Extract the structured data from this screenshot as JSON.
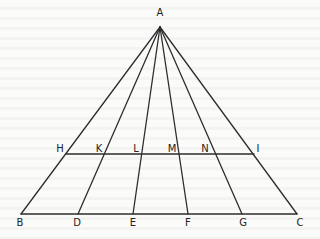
{
  "diagram": {
    "type": "geometry-triangle-with-cevians",
    "points": {
      "A": {
        "x": 160,
        "y": 27,
        "label": "A",
        "lx": 160,
        "ly": 16
      },
      "B": {
        "x": 21,
        "y": 214,
        "label": "B",
        "lx": 20,
        "ly": 226
      },
      "D": {
        "x": 78,
        "y": 214,
        "label": "D",
        "lx": 77,
        "ly": 226
      },
      "E": {
        "x": 133,
        "y": 214,
        "label": "E",
        "lx": 133,
        "ly": 226
      },
      "F": {
        "x": 188,
        "y": 214,
        "label": "F",
        "lx": 188,
        "ly": 226
      },
      "G": {
        "x": 242,
        "y": 214,
        "label": "G",
        "lx": 243,
        "ly": 226
      },
      "C": {
        "x": 297,
        "y": 214,
        "label": "C",
        "lx": 300,
        "ly": 226
      },
      "H": {
        "x": 66,
        "y": 154,
        "label": "H",
        "lx": 60,
        "ly": 152
      },
      "K": {
        "x": 104,
        "y": 154,
        "label": "K",
        "lx": 99,
        "ly": 152
      },
      "L": {
        "x": 142,
        "y": 154,
        "label": "L",
        "lx": 136,
        "ly": 152
      },
      "M": {
        "x": 179,
        "y": 154,
        "label": "M",
        "lx": 172,
        "ly": 152
      },
      "N": {
        "x": 216,
        "y": 154,
        "label": "N",
        "lx": 205,
        "ly": 152
      },
      "I": {
        "x": 254,
        "y": 154,
        "label": "I",
        "lx": 258,
        "ly": 152
      }
    },
    "segments": [
      [
        "A",
        "B"
      ],
      [
        "A",
        "D"
      ],
      [
        "A",
        "E"
      ],
      [
        "A",
        "F"
      ],
      [
        "A",
        "G"
      ],
      [
        "A",
        "C"
      ],
      [
        "B",
        "C"
      ],
      [
        "H",
        "I"
      ]
    ]
  }
}
